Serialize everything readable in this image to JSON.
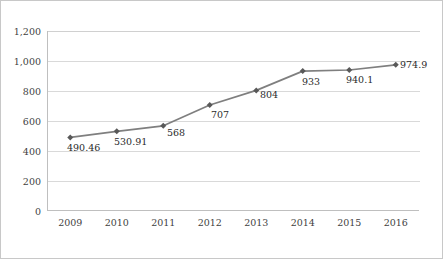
{
  "chart_data": {
    "type": "line",
    "title": "",
    "subtitle": "",
    "xlabel": "",
    "ylabel": "",
    "categories": [
      "2009",
      "2010",
      "2011",
      "2012",
      "2013",
      "2014",
      "2015",
      "2016"
    ],
    "values": [
      490.46,
      530.91,
      568,
      707,
      804,
      933,
      940.1,
      974.9
    ],
    "point_labels": [
      "490.46",
      "530.91",
      "568",
      "707",
      "804",
      "933",
      "940.1",
      "974.9"
    ],
    "series": [
      {
        "name": "",
        "values": [
          490.46,
          530.91,
          568,
          707,
          804,
          933,
          940.1,
          974.9
        ]
      }
    ],
    "ylim": [
      0,
      1200
    ],
    "ytick_values": [
      0,
      200,
      400,
      600,
      800,
      1000,
      1200
    ],
    "ytick_labels": [
      "0",
      "200",
      "400",
      "600",
      "800",
      "1,000",
      "1,200"
    ],
    "grid": "horizontal",
    "legend": "none",
    "marker": "diamond",
    "colors": {
      "line": "#7f7f7f",
      "marker": "#595959",
      "gridline": "#d9d9d9",
      "axis": "#bfbfbf",
      "frame_border": "#c8c8c8",
      "text": "#3f3f3f",
      "background": "#ffffff"
    }
  }
}
